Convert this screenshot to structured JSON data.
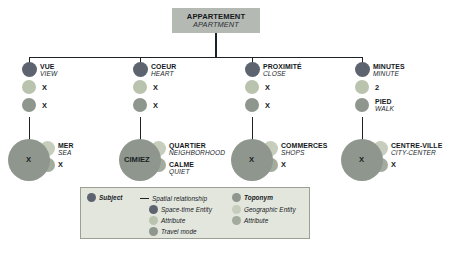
{
  "diagram": {
    "title_fr": "APPARTEMENT",
    "title_en": "APARTMENT",
    "branches": [
      {
        "id": "view",
        "subject_fr": "VUE",
        "subject_en": "VIEW",
        "attr1": "X",
        "attr2": "X",
        "toponym_center": "X",
        "geo_fr": "MER",
        "geo_en": "SEA",
        "geo_attr": "X"
      },
      {
        "id": "heart",
        "subject_fr": "COEUR",
        "subject_en": "HEART",
        "attr1": "X",
        "attr2": "X",
        "toponym_center": "CIMIEZ",
        "geo_fr": "QUARTIER",
        "geo_en": "NEIGHBORHOOD",
        "geo_attr_fr": "CALME",
        "geo_attr_en": "QUIET"
      },
      {
        "id": "close",
        "subject_fr": "PROXIMITÉ",
        "subject_en": "CLOSE",
        "attr1": "X",
        "attr2": "X",
        "toponym_center": "X",
        "geo_fr": "COMMERCES",
        "geo_en": "SHOPS",
        "geo_attr": "X"
      },
      {
        "id": "minute",
        "subject_fr": "MINUTES",
        "subject_en": "MINUTE",
        "attr1": "2",
        "attr2_fr": "PIED",
        "attr2_en": "WALK",
        "toponym_center": "X",
        "geo_fr": "CENTRE-VILLE",
        "geo_en": "CITY-CENTER",
        "geo_attr": "X"
      }
    ]
  },
  "legend": {
    "col1": [
      {
        "marker": "dot-subject",
        "label": "Subject"
      }
    ],
    "col2": [
      {
        "marker": "dash",
        "label": "Spatial relationship"
      },
      {
        "marker": "dot-spacetime",
        "label": "Space-time Entity"
      },
      {
        "marker": "dot-attr-st",
        "label": "Attribute"
      },
      {
        "marker": "dot-travel",
        "label": "Travel mode"
      }
    ],
    "col3": [
      {
        "marker": "dot-toponym",
        "label": "Toponym"
      },
      {
        "marker": "dot-geo",
        "label": "Geographic Entity"
      },
      {
        "marker": "dot-attr-geo",
        "label": "Attribute"
      }
    ]
  },
  "colors": {
    "subject": "#5d6470",
    "spacetime": "#5d6470",
    "attribute_st": "#b9c3ae",
    "travel_mode": "#8e968d",
    "toponym": "#8e968d",
    "geographic_entity": "#c6cdbd",
    "attribute_geo": "#a3aa9e",
    "line": "#1d2227",
    "root_box": "#b5b9b3",
    "legend_bg": "#e3e6dd"
  }
}
